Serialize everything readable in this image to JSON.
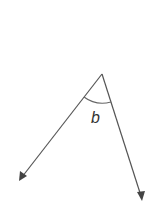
{
  "diagram": {
    "type": "angle",
    "angle_label": "b",
    "vertex": [
      102,
      74
    ],
    "rays": [
      {
        "name": "left-ray",
        "end": [
          20,
          180
        ]
      },
      {
        "name": "right-ray",
        "end": [
          142,
          200
        ]
      }
    ],
    "colors": {
      "line": "#555555",
      "label": "#333333"
    }
  }
}
